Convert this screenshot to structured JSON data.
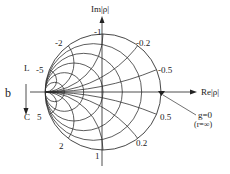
{
  "chart": {
    "type": "smith-admittance",
    "center": [
      103,
      92
    ],
    "radius": 58,
    "g_values": [
      0.2,
      0.5,
      1,
      2,
      5
    ],
    "b_values": [
      0.2,
      0.5,
      1,
      2,
      5,
      -0.2,
      -0.5,
      -1,
      -2,
      -5
    ],
    "line_color": "#333333"
  },
  "labels": {
    "im_axis": "Im|ρ|",
    "re_axis": "Re|ρ|",
    "b_axis": "b",
    "inductive": "L",
    "capacitive": "C",
    "g_zero": "g=0",
    "r_inf": "(r=∞)",
    "b_neg1": "-1",
    "b_neg2": "-2",
    "b_neg5": "-5",
    "b_neg02": "-0.2",
    "b_neg05": "-0.5",
    "b_pos5": "5",
    "b_pos2": "2",
    "b_pos1": "1",
    "b_pos05": "0.5",
    "b_pos02": "0.2"
  }
}
